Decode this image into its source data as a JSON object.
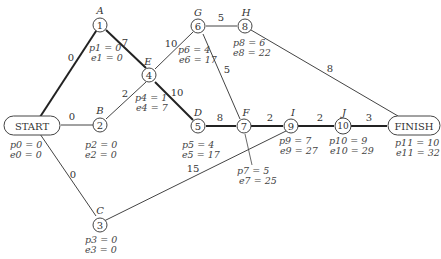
{
  "nodes": [
    {
      "id": "start",
      "label": "START",
      "p": "p0 = 0",
      "e": "e0 = 0"
    },
    {
      "id": "1",
      "letter": "A",
      "num": "1",
      "p": "p1 = 0",
      "e": "e1 = 0"
    },
    {
      "id": "2",
      "letter": "B",
      "num": "2",
      "p": "p2 = 0",
      "e": "e2 = 0"
    },
    {
      "id": "3",
      "letter": "C",
      "num": "3",
      "p": "p3 = 0",
      "e": "e3 = 0"
    },
    {
      "id": "4",
      "letter": "E",
      "num": "4",
      "p": "p4 = 1",
      "e": "e4 = 7"
    },
    {
      "id": "5",
      "letter": "D",
      "num": "5",
      "p": "p5 = 4",
      "e": "e5 = 17"
    },
    {
      "id": "6",
      "letter": "G",
      "num": "6",
      "p": "p6 = 4",
      "e": "e6 = 17"
    },
    {
      "id": "7",
      "letter": "F",
      "num": "7",
      "p": "p7 = 5",
      "e": "e7 = 25"
    },
    {
      "id": "8",
      "letter": "H",
      "num": "8",
      "p": "p8 = 6",
      "e": "e8 = 22"
    },
    {
      "id": "9",
      "letter": "I",
      "num": "9",
      "p": "p9 = 7",
      "e": "e9 = 27"
    },
    {
      "id": "10",
      "letter": "J",
      "num": "10",
      "p": "p10 = 9",
      "e": "e10 = 29"
    },
    {
      "id": "finish",
      "label": "FINISH",
      "p": "p11 = 10",
      "e": "e11 = 32"
    }
  ],
  "edges": [
    {
      "from": "start",
      "to": "1",
      "weight": "0",
      "critical": true
    },
    {
      "from": "start",
      "to": "2",
      "weight": "0",
      "critical": false
    },
    {
      "from": "start",
      "to": "3",
      "weight": "0",
      "critical": false
    },
    {
      "from": "1",
      "to": "4",
      "weight": "7",
      "critical": true
    },
    {
      "from": "2",
      "to": "4",
      "weight": "2",
      "critical": false
    },
    {
      "from": "4",
      "to": "6",
      "weight": "10",
      "critical": false
    },
    {
      "from": "4",
      "to": "5",
      "weight": "10",
      "critical": true
    },
    {
      "from": "6",
      "to": "8",
      "weight": "5",
      "critical": false
    },
    {
      "from": "6",
      "to": "7",
      "weight": "5",
      "critical": false
    },
    {
      "from": "5",
      "to": "7",
      "weight": "8",
      "critical": true
    },
    {
      "from": "7",
      "to": "9",
      "weight": "2",
      "critical": true
    },
    {
      "from": "3",
      "to": "9",
      "weight": "15",
      "critical": false
    },
    {
      "from": "9",
      "to": "10",
      "weight": "2",
      "critical": true
    },
    {
      "from": "10",
      "to": "finish",
      "weight": "3",
      "critical": true
    },
    {
      "from": "8",
      "to": "finish",
      "weight": "8",
      "critical": false
    }
  ],
  "colors": {
    "line": "#444444",
    "critical": "#222222",
    "text": "#333333"
  }
}
